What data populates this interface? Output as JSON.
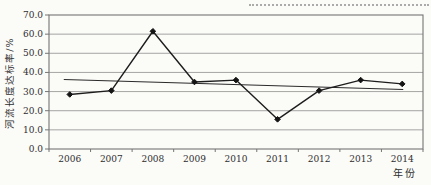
{
  "figure": {
    "y_axis_title": "河流长度达标率/%",
    "x_axis_title": "年份"
  },
  "chart_data": {
    "type": "line",
    "title": "",
    "xlabel": "年份",
    "ylabel": "河流长度达标率/%",
    "categories": [
      "2006",
      "2007",
      "2008",
      "2009",
      "2010",
      "2011",
      "2012",
      "2013",
      "2014"
    ],
    "series": [
      {
        "name": "series-1",
        "values": [
          28.5,
          30.5,
          61.5,
          35.0,
          36.0,
          15.5,
          30.5,
          36.0,
          34.0
        ],
        "marker": "diamond",
        "color": "#1d1d1d"
      }
    ],
    "trendline": {
      "start_value": 36.3,
      "end_value": 31.1,
      "color": "#2a2a2a"
    },
    "ylim": [
      0,
      70
    ],
    "ytick_step": 10,
    "ytick_labels": [
      "0.0",
      "10.0",
      "20.0",
      "30.0",
      "40.0",
      "50.0",
      "60.0",
      "70.0"
    ],
    "grid": true,
    "legend": "none"
  },
  "colors": {
    "background": "#fbfbf8",
    "gridline": "#9b9b9b",
    "plot_border": "#757575",
    "data_line": "#1d1d1d",
    "marker": "#141414",
    "text": "#2e2e2e"
  }
}
